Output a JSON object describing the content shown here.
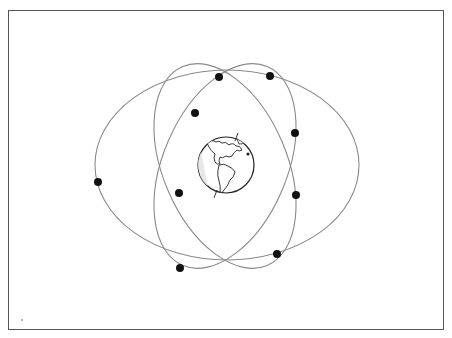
{
  "diagram": {
    "type": "satellite-constellation",
    "colors": {
      "frame": "#555555",
      "orbit": "#8a8a8a",
      "satellite": "#111111",
      "globe_outline": "#222222",
      "background": "#ffffff"
    },
    "earth": {
      "cx": 226,
      "cy": 165,
      "r": 28,
      "label": ""
    },
    "orbits": [
      {
        "name": "wide-orbit",
        "cx": 227,
        "cy": 165,
        "rx": 132,
        "ry": 95,
        "rotate": 0
      },
      {
        "name": "tilted-orbit-a",
        "cx": 225,
        "cy": 166,
        "rx": 62,
        "ry": 108,
        "rotate": -23
      },
      {
        "name": "tilted-orbit-b",
        "cx": 225,
        "cy": 166,
        "rx": 62,
        "ry": 108,
        "rotate": 23
      }
    ],
    "satellites": [
      {
        "x": 219,
        "y": 77
      },
      {
        "x": 270,
        "y": 76
      },
      {
        "x": 195,
        "y": 113
      },
      {
        "x": 295,
        "y": 133
      },
      {
        "x": 98,
        "y": 182
      },
      {
        "x": 179,
        "y": 193
      },
      {
        "x": 296,
        "y": 195
      },
      {
        "x": 277,
        "y": 254
      },
      {
        "x": 180,
        "y": 268
      }
    ]
  }
}
